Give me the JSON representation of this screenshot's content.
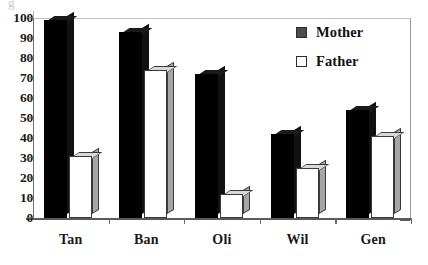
{
  "chart_data": {
    "type": "bar",
    "title": "",
    "xlabel": "",
    "ylabel": "",
    "categories": [
      "Tan",
      "Ban",
      "Oli",
      "Wil",
      "Gen"
    ],
    "series": [
      {
        "name": "Mother",
        "values": [
          99,
          93,
          72,
          42,
          54
        ],
        "color": "#000000"
      },
      {
        "name": "Father",
        "values": [
          31,
          74,
          12,
          25,
          41
        ],
        "color": "#ffffff"
      }
    ],
    "ylim": [
      0,
      100
    ],
    "yticks": [
      0,
      10,
      20,
      30,
      40,
      50,
      60,
      70,
      80,
      90,
      100
    ],
    "ytick_labels": [
      "0",
      "10",
      "20",
      "30",
      "40",
      "50",
      "60",
      "70",
      "80",
      "90",
      "100"
    ],
    "grid": false,
    "legend_position": "top-right",
    "legend_entries": [
      "Mother",
      "Father"
    ],
    "style": "3d-column"
  },
  "artifact": {
    "top_left_fragment": "g"
  }
}
